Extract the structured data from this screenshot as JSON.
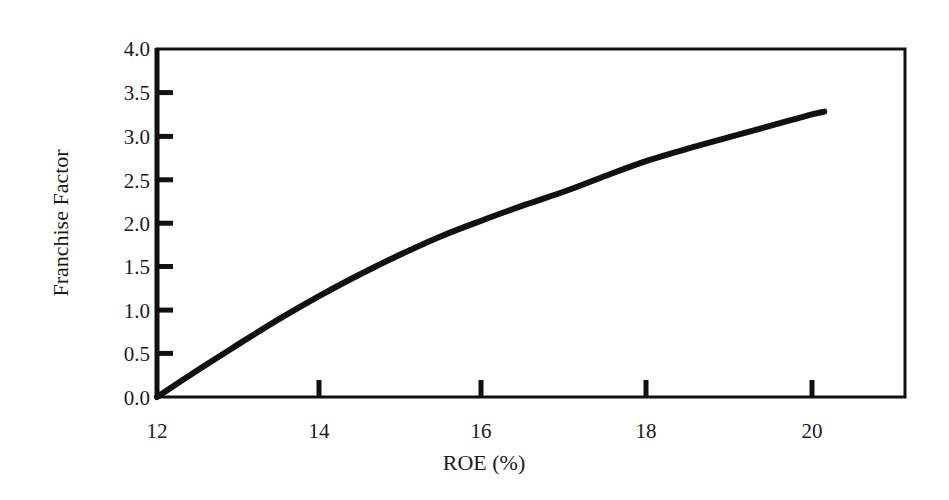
{
  "chart_data": {
    "type": "line",
    "title": "",
    "xlabel": "ROE (%)",
    "ylabel": "Franchise Factor",
    "xlim": [
      12,
      21.1
    ],
    "ylim": [
      0,
      4.0
    ],
    "grid": false,
    "legend": null,
    "x_ticks": [
      12,
      14,
      16,
      18,
      20
    ],
    "x_tick_labels": [
      "12",
      "14",
      "16",
      "18",
      "20"
    ],
    "y_ticks": [
      0.0,
      0.5,
      1.0,
      1.5,
      2.0,
      2.5,
      3.0,
      3.5,
      4.0
    ],
    "y_tick_labels": [
      "0.0",
      "0.5",
      "1.0",
      "1.5",
      "2.0",
      "2.5",
      "3.0",
      "3.5",
      "4.0"
    ],
    "series": [
      {
        "name": "Franchise Factor",
        "color": "#111111",
        "x": [
          12,
          12.5,
          13,
          13.5,
          14,
          14.5,
          15,
          15.5,
          16,
          16.5,
          17,
          17.5,
          18,
          18.5,
          19,
          19.5,
          20,
          20.15
        ],
        "y": [
          0.0,
          0.31,
          0.61,
          0.9,
          1.17,
          1.42,
          1.65,
          1.86,
          2.04,
          2.21,
          2.37,
          2.55,
          2.72,
          2.86,
          2.99,
          3.12,
          3.25,
          3.28
        ]
      }
    ]
  },
  "labels": {
    "xlabel": "ROE (%)",
    "ylabel": "Franchise Factor",
    "x_ticks": [
      "12",
      "14",
      "16",
      "18",
      "20"
    ],
    "y_ticks": [
      "0.0",
      "0.5",
      "1.0",
      "1.5",
      "2.0",
      "2.5",
      "3.0",
      "3.5",
      "4.0"
    ]
  },
  "colors": {
    "line": "#111111",
    "axis": "#111111",
    "background": "#ffffff"
  }
}
